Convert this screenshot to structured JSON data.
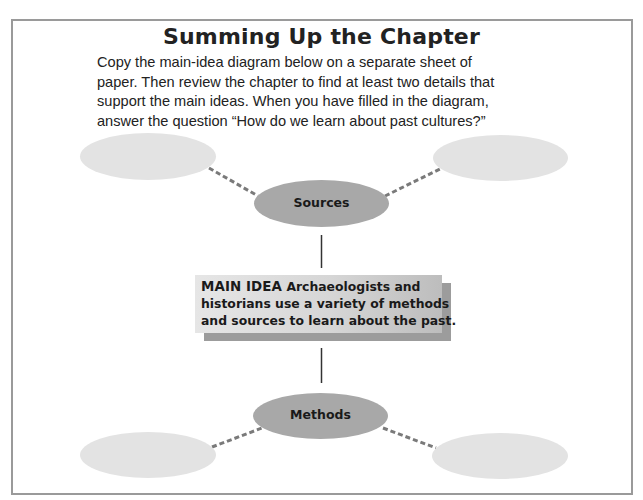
{
  "page": {
    "title": "Summing Up the Chapter",
    "instructions": [
      "Copy the main-idea diagram below on a separate sheet of",
      "paper. Then review the chapter to find at least two details that",
      "support the main ideas. When you have filled in the diagram,",
      "answer the question “How do we learn about past cultures?”"
    ]
  },
  "diagram": {
    "main_idea": {
      "lead": "MAIN IDEA",
      "lines": [
        "Archaeologists and",
        "historians use a variety of methods",
        "and sources to learn about the past."
      ]
    },
    "nodes": {
      "top": {
        "label": "Sources"
      },
      "bottom": {
        "label": "Methods"
      }
    },
    "detail_ovals": {
      "top_left": "",
      "top_right": "",
      "bottom_left": "",
      "bottom_right": ""
    },
    "colors": {
      "node_fill": "#a8a8a8",
      "detail_fill": "#e3e3e3",
      "connector": "#7a7a7a",
      "frame": "#9a9a9a"
    }
  }
}
